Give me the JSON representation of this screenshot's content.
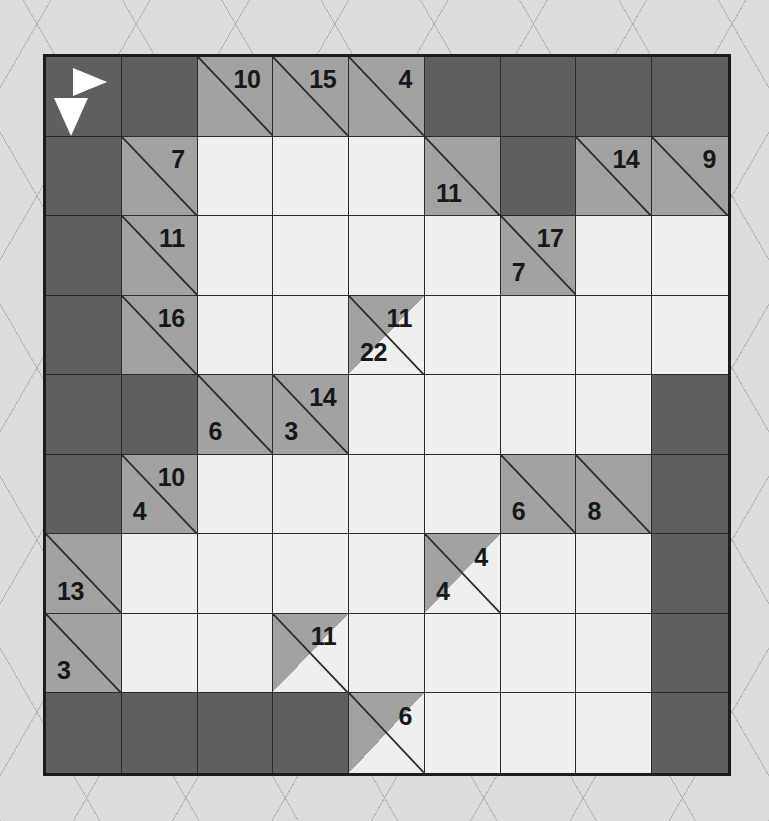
{
  "puzzle": {
    "type": "kakuro",
    "rows": 9,
    "columns": 9,
    "colors": {
      "block": "#5f5f5f",
      "clue": "#a2a2a2",
      "entry": "#eef0ee",
      "grid_line": "#2b2b2b",
      "border": "#1c1c1c",
      "page": "#dcdcdc",
      "clue_text": "#16181a",
      "legend_arrow": "#ffffff"
    },
    "legend": {
      "across_icon": "arrow-right-icon",
      "down_icon": "arrow-down-icon"
    },
    "grid": [
      [
        {
          "kind": "legend"
        },
        {
          "kind": "block"
        },
        {
          "kind": "clue",
          "down": "10",
          "full": true
        },
        {
          "kind": "clue",
          "down": "15",
          "full": true
        },
        {
          "kind": "clue",
          "down": "4",
          "full": true
        },
        {
          "kind": "block"
        },
        {
          "kind": "block"
        },
        {
          "kind": "block"
        },
        {
          "kind": "block"
        }
      ],
      [
        {
          "kind": "block"
        },
        {
          "kind": "clue",
          "down": "7",
          "full": true
        },
        {
          "kind": "entry"
        },
        {
          "kind": "entry"
        },
        {
          "kind": "entry"
        },
        {
          "kind": "clue",
          "across": "11",
          "full": true
        },
        {
          "kind": "block"
        },
        {
          "kind": "clue",
          "down": "14",
          "full": true
        },
        {
          "kind": "clue",
          "down": "9",
          "full": true
        }
      ],
      [
        {
          "kind": "block"
        },
        {
          "kind": "clue",
          "down": "11",
          "full": true
        },
        {
          "kind": "entry"
        },
        {
          "kind": "entry"
        },
        {
          "kind": "entry"
        },
        {
          "kind": "entry"
        },
        {
          "kind": "clue",
          "across": "7",
          "down": "17",
          "full": true
        },
        {
          "kind": "entry"
        },
        {
          "kind": "entry"
        }
      ],
      [
        {
          "kind": "block"
        },
        {
          "kind": "clue",
          "down": "16",
          "full": true
        },
        {
          "kind": "entry"
        },
        {
          "kind": "entry"
        },
        {
          "kind": "clue",
          "across": "22",
          "down": "11",
          "full": false
        },
        {
          "kind": "entry"
        },
        {
          "kind": "entry"
        },
        {
          "kind": "entry"
        },
        {
          "kind": "entry"
        }
      ],
      [
        {
          "kind": "block"
        },
        {
          "kind": "block"
        },
        {
          "kind": "clue",
          "across": "6",
          "full": true
        },
        {
          "kind": "clue",
          "across": "3",
          "down": "14",
          "full": true
        },
        {
          "kind": "entry"
        },
        {
          "kind": "entry"
        },
        {
          "kind": "entry"
        },
        {
          "kind": "entry"
        },
        {
          "kind": "block"
        }
      ],
      [
        {
          "kind": "block"
        },
        {
          "kind": "clue",
          "across": "4",
          "down": "10",
          "full": true
        },
        {
          "kind": "entry"
        },
        {
          "kind": "entry"
        },
        {
          "kind": "entry"
        },
        {
          "kind": "entry"
        },
        {
          "kind": "clue",
          "across": "6",
          "full": true
        },
        {
          "kind": "clue",
          "across": "8",
          "full": true
        },
        {
          "kind": "block"
        }
      ],
      [
        {
          "kind": "clue",
          "across": "13",
          "full": true
        },
        {
          "kind": "entry"
        },
        {
          "kind": "entry"
        },
        {
          "kind": "entry"
        },
        {
          "kind": "entry"
        },
        {
          "kind": "clue",
          "across": "4",
          "down": "4",
          "full": false
        },
        {
          "kind": "entry"
        },
        {
          "kind": "entry"
        },
        {
          "kind": "block"
        }
      ],
      [
        {
          "kind": "clue",
          "across": "3",
          "full": true
        },
        {
          "kind": "entry"
        },
        {
          "kind": "entry"
        },
        {
          "kind": "clue",
          "down": "11",
          "full": false
        },
        {
          "kind": "entry"
        },
        {
          "kind": "entry"
        },
        {
          "kind": "entry"
        },
        {
          "kind": "entry"
        },
        {
          "kind": "block"
        }
      ],
      [
        {
          "kind": "block"
        },
        {
          "kind": "block"
        },
        {
          "kind": "block"
        },
        {
          "kind": "block"
        },
        {
          "kind": "clue",
          "down": "6",
          "full": false
        },
        {
          "kind": "entry"
        },
        {
          "kind": "entry"
        },
        {
          "kind": "entry"
        },
        {
          "kind": "block"
        }
      ]
    ]
  }
}
